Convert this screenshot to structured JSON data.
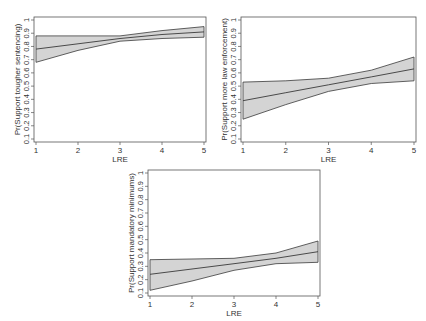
{
  "chart_data": [
    {
      "type": "line",
      "title": "",
      "xlabel": "LRE",
      "ylabel": "Pr(Support tougher sentencing)",
      "x": [
        1,
        2,
        3,
        4,
        5
      ],
      "xlim": [
        1,
        5
      ],
      "ylim": [
        0.1,
        1
      ],
      "xticks": [
        "1",
        "2",
        "3",
        "4",
        "5"
      ],
      "yticks": [
        "0.1",
        "0.2",
        "0.3",
        "0.4",
        "0.5",
        "0.6",
        "0.7",
        "0.8",
        "0.9",
        "1"
      ],
      "grid": false,
      "legend": "none",
      "series": [
        {
          "name": "predicted",
          "values": [
            0.78,
            0.82,
            0.86,
            0.89,
            0.91
          ]
        },
        {
          "name": "upper_ci",
          "values": [
            0.88,
            0.88,
            0.88,
            0.92,
            0.95
          ]
        },
        {
          "name": "lower_ci",
          "values": [
            0.68,
            0.77,
            0.84,
            0.86,
            0.87
          ]
        }
      ],
      "frame": {
        "x": 34,
        "y": 17,
        "w": 172,
        "h": 125
      }
    },
    {
      "type": "line",
      "title": "",
      "xlabel": "LRE",
      "ylabel": "Pr(Support more law enforcement)",
      "x": [
        1,
        2,
        3,
        4,
        5
      ],
      "xlim": [
        1,
        5
      ],
      "ylim": [
        0.1,
        1
      ],
      "xticks": [
        "1",
        "2",
        "3",
        "4",
        "5"
      ],
      "yticks": [
        "0.1",
        "0.2",
        "0.3",
        "0.4",
        "0.5",
        "0.6",
        "0.7",
        "0.8",
        "0.9",
        "1"
      ],
      "grid": false,
      "legend": "none",
      "series": [
        {
          "name": "predicted",
          "values": [
            0.39,
            0.45,
            0.51,
            0.57,
            0.63
          ]
        },
        {
          "name": "upper_ci",
          "values": [
            0.53,
            0.54,
            0.56,
            0.62,
            0.72
          ]
        },
        {
          "name": "lower_ci",
          "values": [
            0.25,
            0.36,
            0.46,
            0.52,
            0.54
          ]
        }
      ],
      "frame": {
        "x": 241,
        "y": 17,
        "w": 175,
        "h": 125
      }
    },
    {
      "type": "line",
      "title": "",
      "xlabel": "LRE",
      "ylabel": "Pr(Support mandatory minimums)",
      "x": [
        1,
        2,
        3,
        4,
        5
      ],
      "xlim": [
        1,
        5
      ],
      "ylim": [
        0.1,
        1
      ],
      "xticks": [
        "1",
        "2",
        "3",
        "4",
        "5"
      ],
      "yticks": [
        "0.1",
        "0.2",
        "0.3",
        "0.4",
        "0.5",
        "0.6",
        "0.7",
        "0.8",
        "0.9",
        "1"
      ],
      "grid": false,
      "legend": "none",
      "series": [
        {
          "name": "predicted",
          "values": [
            0.24,
            0.28,
            0.32,
            0.36,
            0.41
          ]
        },
        {
          "name": "upper_ci",
          "values": [
            0.35,
            0.355,
            0.36,
            0.4,
            0.49
          ]
        },
        {
          "name": "lower_ci",
          "values": [
            0.12,
            0.19,
            0.27,
            0.32,
            0.33
          ]
        }
      ],
      "frame": {
        "x": 148,
        "y": 170,
        "w": 172,
        "h": 126
      }
    }
  ],
  "colors": {
    "band_fill": "#d4d4d4",
    "line": "#3a3a3a",
    "frame": "#555555",
    "text": "#333333"
  }
}
